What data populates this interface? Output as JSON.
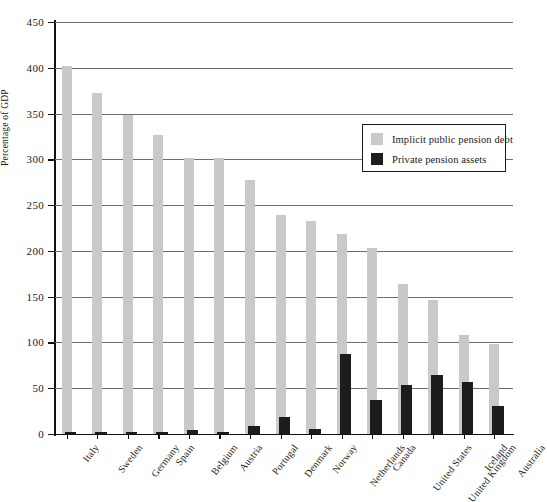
{
  "chart_data": {
    "type": "bar",
    "title": "",
    "subtitle": "",
    "xlabel": "",
    "ylabel": "Percentage of GDP",
    "ylim": [
      0,
      450
    ],
    "ytick_values": [
      0,
      50,
      100,
      150,
      200,
      250,
      300,
      350,
      400,
      450
    ],
    "ytick_labels": [
      "0",
      "50",
      "100",
      "150",
      "200",
      "250",
      "300",
      "350",
      "400",
      "450"
    ],
    "grid": "horizontal",
    "legend_position": "upper-right",
    "categories": [
      "Italy",
      "Sweden",
      "Germany",
      "Spain",
      "Belgium",
      "Austria",
      "Portugal",
      "Denmark",
      "Norway",
      "Netherlands",
      "Canada",
      "United States",
      "United Kingdom",
      "Iceland",
      "Australia"
    ],
    "series": [
      {
        "name": "Implicit public pension debt",
        "color": "#c9c9c9",
        "values": [
          402,
          372,
          348,
          327,
          301,
          301,
          278,
          239,
          233,
          218,
          203,
          164,
          146,
          108,
          98
        ]
      },
      {
        "name": "Private pension assets",
        "color": "#1c1c1c",
        "values": [
          2,
          2,
          2,
          2,
          4,
          1,
          9,
          19,
          6,
          87,
          37,
          54,
          65,
          57,
          31
        ]
      }
    ]
  },
  "legend": {
    "items": [
      {
        "label": "Implicit public pension debt",
        "swatch": "#c9c9c9"
      },
      {
        "label": "Private pension assets",
        "swatch": "#1c1c1c"
      }
    ]
  }
}
